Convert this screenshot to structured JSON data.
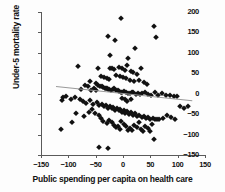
{
  "chart_data": {
    "type": "scatter",
    "title": "",
    "xlabel": "Public spending per capita on health care",
    "ylabel": "Under-5 mortality rate",
    "xlim": [
      -150,
      150
    ],
    "ylim": [
      -150,
      200
    ],
    "xticks": [
      -150,
      -100,
      -50,
      0,
      50,
      100,
      150
    ],
    "yticks": [
      200,
      150,
      100,
      50,
      0,
      -50,
      -100,
      -150
    ],
    "xticklabels": [
      "−150",
      "−100",
      "−50",
      "0",
      "50",
      "100",
      "150"
    ],
    "yticklabels": [
      "200",
      "150",
      "100",
      "50",
      "0",
      "−50",
      "−100",
      "−150"
    ],
    "grid": false,
    "legend": false,
    "marker": "diamond",
    "marker_color": "#111111",
    "trendline": {
      "color": "#9a9a9a",
      "x_start": -122,
      "y_start": 19,
      "x_end": 128,
      "y_end": -16
    },
    "points": [
      [
        -4,
        185
      ],
      [
        57,
        166
      ],
      [
        -28,
        142
      ],
      [
        60,
        140
      ],
      [
        -14,
        131
      ],
      [
        -82,
        69
      ],
      [
        22,
        113
      ],
      [
        -24,
        94
      ],
      [
        10,
        88
      ],
      [
        33,
        64
      ],
      [
        -23,
        63
      ],
      [
        -20,
        62
      ],
      [
        -17,
        61
      ],
      [
        -8,
        66
      ],
      [
        -2,
        63
      ],
      [
        4,
        58
      ],
      [
        8,
        70
      ],
      [
        14,
        56
      ],
      [
        18,
        52
      ],
      [
        25,
        48
      ],
      [
        -40,
        44
      ],
      [
        -34,
        41
      ],
      [
        -30,
        38
      ],
      [
        -26,
        36
      ],
      [
        -12,
        47
      ],
      [
        -6,
        44
      ],
      [
        0,
        40
      ],
      [
        6,
        38
      ],
      [
        12,
        34
      ],
      [
        20,
        30
      ],
      [
        30,
        33
      ],
      [
        38,
        28
      ],
      [
        44,
        24
      ],
      [
        -46,
        22
      ],
      [
        -42,
        20
      ],
      [
        -38,
        18
      ],
      [
        -36,
        16
      ],
      [
        -33,
        15
      ],
      [
        -31,
        14
      ],
      [
        -29,
        13
      ],
      [
        -27,
        12
      ],
      [
        -25,
        11
      ],
      [
        -22,
        10
      ],
      [
        -19,
        12
      ],
      [
        -16,
        14
      ],
      [
        -69,
        22
      ],
      [
        -64,
        18
      ],
      [
        -58,
        10
      ],
      [
        -53,
        14
      ],
      [
        -49,
        8
      ],
      [
        -13,
        9
      ],
      [
        -10,
        8
      ],
      [
        -7,
        6
      ],
      [
        -4,
        5
      ],
      [
        -1,
        4
      ],
      [
        2,
        6
      ],
      [
        5,
        3
      ],
      [
        9,
        2
      ],
      [
        13,
        1
      ],
      [
        16,
        5
      ],
      [
        19,
        3
      ],
      [
        23,
        0
      ],
      [
        27,
        2
      ],
      [
        31,
        -1
      ],
      [
        35,
        1
      ],
      [
        40,
        3
      ],
      [
        46,
        0
      ],
      [
        52,
        -2
      ],
      [
        58,
        4
      ],
      [
        64,
        -3
      ],
      [
        71,
        1
      ],
      [
        78,
        -4
      ],
      [
        86,
        -2
      ],
      [
        93,
        -6
      ],
      [
        99,
        -5
      ],
      [
        -110,
        -7
      ],
      [
        -104,
        -5
      ],
      [
        -96,
        -12
      ],
      [
        -88,
        -9
      ],
      [
        -79,
        -14
      ],
      [
        -74,
        -18
      ],
      [
        -67,
        -22
      ],
      [
        -61,
        -16
      ],
      [
        -55,
        -24
      ],
      [
        -48,
        -20
      ],
      [
        -43,
        -28
      ],
      [
        -39,
        -25
      ],
      [
        -35,
        -31
      ],
      [
        -32,
        -27
      ],
      [
        -28,
        -34
      ],
      [
        -24,
        -30
      ],
      [
        -21,
        -36
      ],
      [
        -18,
        -33
      ],
      [
        -15,
        -39
      ],
      [
        -11,
        -35
      ],
      [
        -8,
        -41
      ],
      [
        -5,
        -38
      ],
      [
        -2,
        -44
      ],
      [
        1,
        -40
      ],
      [
        4,
        -46
      ],
      [
        7,
        -43
      ],
      [
        11,
        -49
      ],
      [
        15,
        -45
      ],
      [
        18,
        -52
      ],
      [
        22,
        -48
      ],
      [
        26,
        -55
      ],
      [
        30,
        -51
      ],
      [
        34,
        -58
      ],
      [
        38,
        -54
      ],
      [
        42,
        -60
      ],
      [
        46,
        -57
      ],
      [
        50,
        -62
      ],
      [
        54,
        -59
      ],
      [
        58,
        -63
      ],
      [
        62,
        -61
      ],
      [
        -112,
        -16
      ],
      [
        -113,
        -86
      ],
      [
        -93,
        -69
      ],
      [
        -86,
        -48
      ],
      [
        -71,
        -54
      ],
      [
        -63,
        -44
      ],
      [
        -57,
        -38
      ],
      [
        -51,
        -46
      ],
      [
        -44,
        -52
      ],
      [
        -41,
        -60
      ],
      [
        -36,
        -66
      ],
      [
        -30,
        -72
      ],
      [
        -25,
        -64
      ],
      [
        -20,
        -70
      ],
      [
        -16,
        -76
      ],
      [
        -12,
        -82
      ],
      [
        -9,
        -78
      ],
      [
        -6,
        -86
      ],
      [
        -3,
        -68
      ],
      [
        1,
        -74
      ],
      [
        5,
        -80
      ],
      [
        9,
        -88
      ],
      [
        13,
        -84
      ],
      [
        17,
        -90
      ],
      [
        21,
        -76
      ],
      [
        25,
        -82
      ],
      [
        29,
        -70
      ],
      [
        33,
        -86
      ],
      [
        37,
        -92
      ],
      [
        41,
        -79
      ],
      [
        45,
        -85
      ],
      [
        49,
        -91
      ],
      [
        53,
        -73
      ],
      [
        57,
        -112
      ],
      [
        66,
        -61
      ],
      [
        73,
        -59
      ],
      [
        80,
        -52
      ],
      [
        88,
        -58
      ],
      [
        95,
        -63
      ],
      [
        104,
        -30
      ],
      [
        111,
        -34
      ],
      [
        118,
        -31
      ],
      [
        -44,
        -130
      ],
      [
        -28,
        -133
      ],
      [
        -2,
        -10
      ],
      [
        3,
        -14
      ],
      [
        8,
        -18
      ],
      [
        14,
        -12
      ],
      [
        -45,
        62
      ],
      [
        -50,
        27
      ],
      [
        -60,
        30
      ],
      [
        -77,
        12
      ]
    ]
  }
}
